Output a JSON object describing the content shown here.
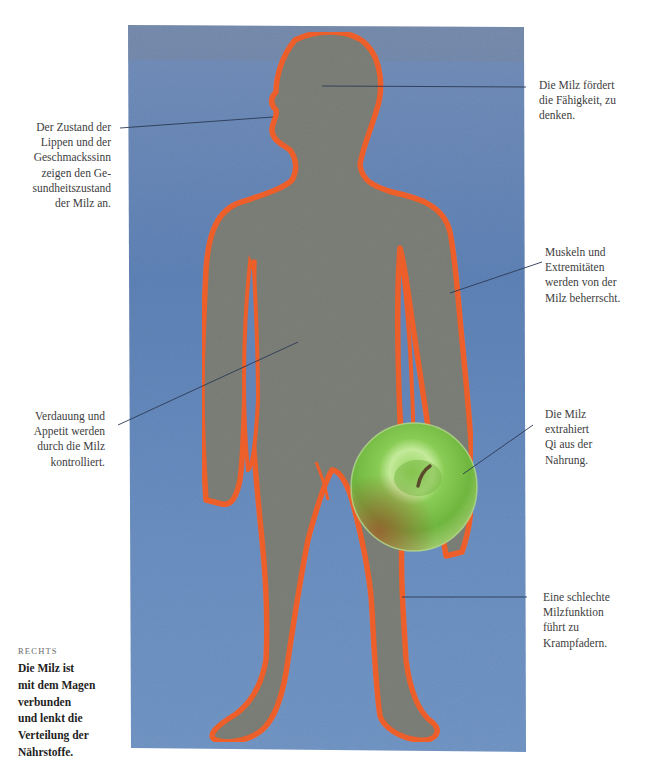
{
  "illustration": {
    "subject": "human-figure-silhouette-with-apple",
    "colors": {
      "background_blue": "#6d8fbf",
      "background_blue_dark": "#557aa9",
      "body_gray": "#7c7f78",
      "outline_orange": "#f2612b",
      "apple_green": "#7cc24a",
      "apple_highlight": "#c8ec9a",
      "apple_red_tint": "#a7552c",
      "leader_line": "#2b3a55"
    }
  },
  "annotations": {
    "lips": "Der Zustand der\nLippen und der\nGeschmackssinn\nzeigen den Ge-\nsundheitszustand\nder Milz an.",
    "thinking": "Die Milz fördert\ndie Fähigkeit, zu\ndenken.",
    "muscles": "Muskeln und\nExtremitäten\nwerden von der\nMilz beherrscht.",
    "digestion": "Verdauung und\nAppetit werden\ndurch die Milz\nkontrolliert.",
    "qi": "Die Milz\nextrahiert\nQi aus der\nNahrung.",
    "varicose": "Eine schlechte\nMilzfunktion\nführt zu\nKrampfadern."
  },
  "sidebar": {
    "kicker": "RECHTS",
    "text": "Die Milz ist\nmit dem Magen\nverbunden\nund lenkt die\nVerteilung der\nNährstoffe."
  }
}
